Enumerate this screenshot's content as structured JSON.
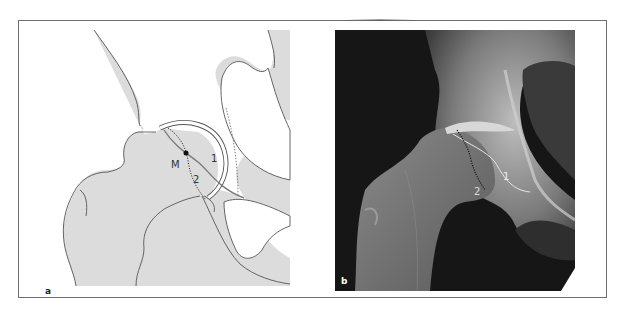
{
  "figure": {
    "panels": [
      {
        "id": "a",
        "label": "a",
        "kind": "schematic drawing",
        "annotations": {
          "center_point": "M",
          "line1": "1",
          "line2": "2"
        }
      },
      {
        "id": "b",
        "label": "b",
        "kind": "radiograph",
        "annotations": {
          "line1": "1",
          "line2": "2"
        }
      }
    ]
  },
  "colors": {
    "frame": "#6e6e6e",
    "bone_fill": "#dcdcdc",
    "outline": "#555555",
    "curve_line": "#7a7a7a",
    "xray_dark": "#161616"
  }
}
